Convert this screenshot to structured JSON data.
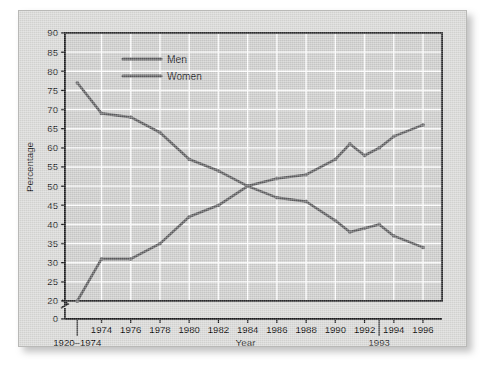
{
  "chart_data": {
    "type": "line",
    "title": "",
    "xlabel": "Year",
    "ylabel": "Percentage",
    "ylim": [
      0,
      90
    ],
    "ybreak": [
      0,
      20
    ],
    "yticks": [
      0,
      20,
      25,
      30,
      35,
      40,
      45,
      50,
      55,
      60,
      65,
      70,
      75,
      80,
      85,
      90
    ],
    "xticks": [
      "1974",
      "1976",
      "1978",
      "1980",
      "1982",
      "1984",
      "1986",
      "1988",
      "1990",
      "1992",
      "1994",
      "1996"
    ],
    "x_first_label": "1920–1974",
    "x_annotation": "1993",
    "grid": true,
    "legend_position": "top-left-inside",
    "x": [
      "1920-1974",
      "1974",
      "1976",
      "1978",
      "1980",
      "1982",
      "1984",
      "1986",
      "1988",
      "1990",
      "1991",
      "1992",
      "1993",
      "1994",
      "1996"
    ],
    "series": [
      {
        "name": "Men",
        "color": "#5a5a5c",
        "values": [
          77,
          69,
          68,
          64,
          57,
          54,
          50,
          47,
          46,
          41,
          38,
          39,
          40,
          37,
          34
        ]
      },
      {
        "name": "Women",
        "color": "#5a5a5c",
        "values": [
          20,
          31,
          31,
          35,
          42,
          45,
          50,
          52,
          53,
          57,
          61,
          58,
          60,
          63,
          66
        ]
      }
    ]
  },
  "legend": {
    "items": [
      {
        "label": "Men"
      },
      {
        "label": "Women"
      }
    ]
  },
  "axes": {
    "y_title": "Percentage",
    "x_title": "Year"
  },
  "colors": {
    "line": "#5a5a5c",
    "plot_background": "#cccccb",
    "card_background": "#d8d8d6",
    "grid": "#ffffff",
    "frame": "#1b1b1d",
    "text": "#18181a"
  }
}
